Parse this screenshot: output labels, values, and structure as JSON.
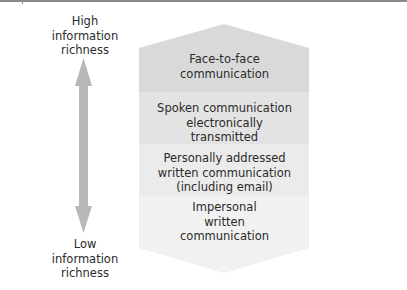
{
  "axis": {
    "top_label": "High information richness",
    "top_label_lines": [
      "High",
      "information",
      "richness"
    ],
    "bottom_label": "Low information richness",
    "bottom_label_lines": [
      "Low",
      "information",
      "richness"
    ],
    "arrow_color": "#b8b8b8"
  },
  "hierarchy": {
    "bands": [
      {
        "label": "Face-to-face communication",
        "lines": [
          "Face-to-face",
          "communication"
        ],
        "color": "#d9d9d9"
      },
      {
        "label": "Spoken communication electronically transmitted",
        "lines": [
          "Spoken communication",
          "electronically",
          "transmitted"
        ],
        "color": "#e3e3e3"
      },
      {
        "label": "Personally addressed written communication (including email)",
        "lines": [
          "Personally addressed",
          "written communication",
          "(including email)"
        ],
        "color": "#ebebeb"
      },
      {
        "label": "Impersonal written communication",
        "lines": [
          "Impersonal",
          "written",
          "communication"
        ],
        "color": "#f1f1f1"
      }
    ]
  }
}
